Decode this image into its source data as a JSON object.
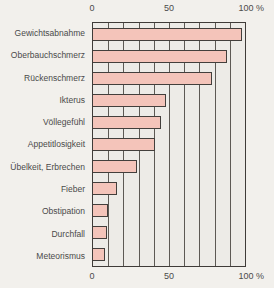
{
  "figure": {
    "unit": "%"
  },
  "chart_data": {
    "type": "bar",
    "orientation": "horizontal",
    "categories": [
      "Gewichtsabnahme",
      "Oberbauchschmerz",
      "Rückenschmerz",
      "Ikterus",
      "Völlegefühl",
      "Appetitlosigkeit",
      "Übelkeit, Erbrechen",
      "Fieber",
      "Obstipation",
      "Durchfall",
      "Meteorismus"
    ],
    "values": [
      98,
      88,
      78,
      48,
      45,
      41,
      29,
      16,
      10,
      9,
      8
    ],
    "title": "",
    "xlabel": "%",
    "ylabel": "",
    "xlim": [
      0,
      100
    ],
    "xticks": [
      0,
      50,
      100
    ],
    "xtick_labels": [
      "0",
      "50",
      "100"
    ],
    "grid": "vertical",
    "grid_step": 10,
    "legend": "none",
    "bar_color": "#f4c4ba",
    "bar_border_color": "#433f3c"
  }
}
